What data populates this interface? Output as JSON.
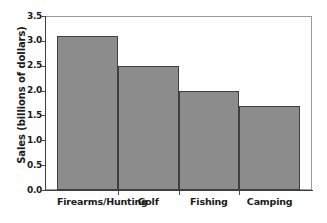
{
  "chart_data": {
    "type": "bar",
    "title": "",
    "xlabel": "",
    "ylabel": "Sales (billions of dollars)",
    "categories": [
      "Firearms/Hunting",
      "Golf",
      "Fishing",
      "Camping"
    ],
    "values": [
      3.1,
      2.5,
      2.0,
      1.7
    ],
    "ylim": [
      0.0,
      3.5
    ],
    "ytick_labels": [
      "0.0",
      "0.5",
      "1.0",
      "1.5",
      "2.0",
      "2.5",
      "3.0",
      "3.5"
    ],
    "ytick_values": [
      0.0,
      0.5,
      1.0,
      1.5,
      2.0,
      2.5,
      3.0,
      3.5
    ],
    "grid": false,
    "legend": null,
    "bar_fill_color": "#8c8c8c",
    "bar_edge_color": "#3f3f3f",
    "background_color": "#ffffff",
    "axis_color": "#3d3d3d",
    "frame_color": "#9a9a9a"
  }
}
